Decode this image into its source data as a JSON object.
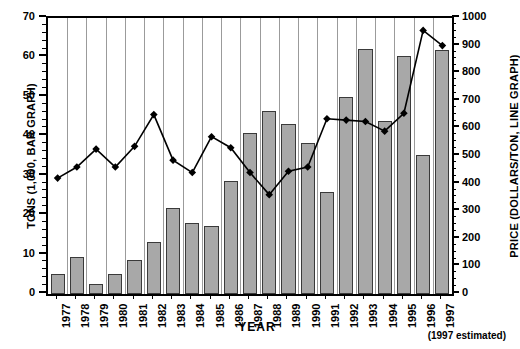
{
  "chart_data": {
    "type": "bar",
    "title": "",
    "xlabel": "YEAR",
    "ylabel": "TONS (1,000, BAR GRAPH)",
    "y2label": "PRICE (DOLLARS/TON, LINE GRAPH)",
    "footnote": "(1997 estimated)",
    "grid": true,
    "legend": "none",
    "categories": [
      "1977",
      "1978",
      "1979",
      "1980",
      "1981",
      "1982",
      "1983",
      "1984",
      "1985",
      "1986",
      "1987",
      "1988",
      "1989",
      "1990",
      "1991",
      "1992",
      "1993",
      "1994",
      "1995",
      "1996",
      "1997"
    ],
    "ylim": [
      0,
      70
    ],
    "yticks": [
      0,
      10,
      20,
      30,
      40,
      50,
      60,
      70
    ],
    "y2lim": [
      0,
      1000
    ],
    "y2ticks": [
      0,
      100,
      200,
      300,
      400,
      500,
      600,
      700,
      800,
      900,
      1000
    ],
    "series": [
      {
        "name": "TONS (1,000, BAR GRAPH)",
        "type": "bar",
        "axis": "left",
        "color": "#a8a8a8",
        "values": [
          5.0,
          9.5,
          2.5,
          5.0,
          8.7,
          13.2,
          21.7,
          18.0,
          17.3,
          28.7,
          40.8,
          46.3,
          43.0,
          38.3,
          26.0,
          50.0,
          62.2,
          44.0,
          60.3,
          35.2,
          62.0
        ]
      },
      {
        "name": "PRICE (DOLLARS/TON, LINE GRAPH)",
        "type": "line",
        "axis": "right",
        "color": "#000000",
        "values": [
          420,
          460,
          525,
          460,
          535,
          650,
          485,
          440,
          570,
          530,
          440,
          360,
          445,
          460,
          635,
          630,
          625,
          590,
          655,
          955,
          900
        ]
      }
    ]
  }
}
